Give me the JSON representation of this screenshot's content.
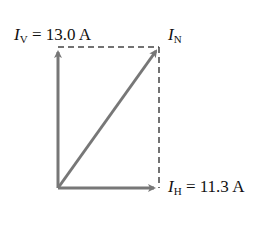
{
  "diagram": {
    "type": "vector-components",
    "labels": {
      "vertical": {
        "symbol": "I",
        "subscript": "V",
        "value": "= 13.0 A"
      },
      "resultant": {
        "symbol": "I",
        "subscript": "N"
      },
      "horizontal": {
        "symbol": "I",
        "subscript": "H",
        "value": "= 11.3 A"
      }
    },
    "colors": {
      "arrow": "#777777",
      "dashed": "#444444",
      "text": "#111111"
    }
  }
}
